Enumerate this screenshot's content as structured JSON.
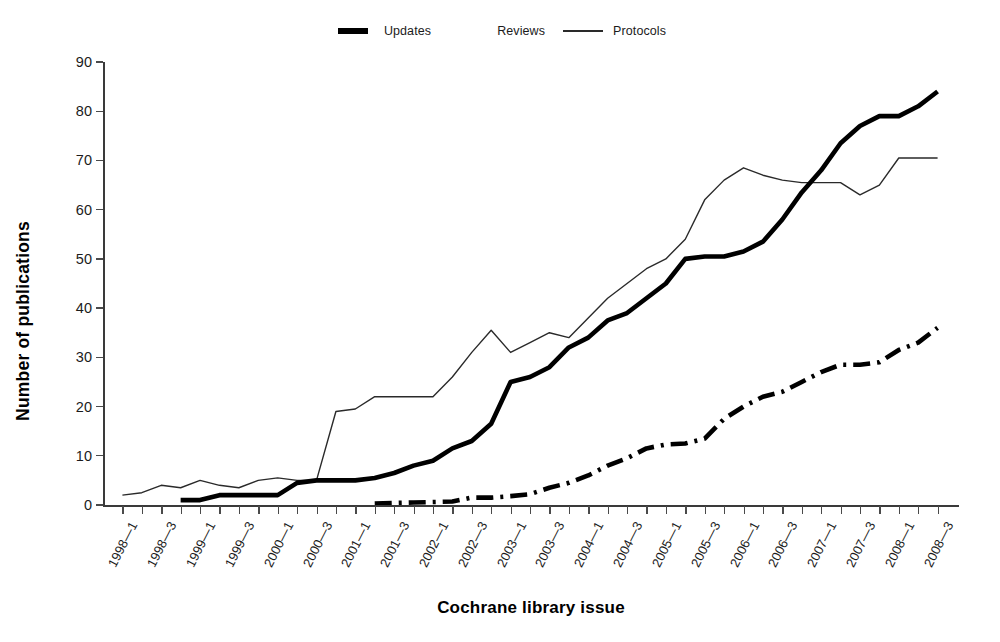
{
  "legend": {
    "entries": [
      {
        "label": "Updates",
        "style": "thick-dashdot",
        "marker": "updates"
      },
      {
        "label": "Reviews",
        "style": "thick-solid",
        "marker": "reviews"
      },
      {
        "label": "Protocols",
        "style": "thin-solid",
        "marker": "protocols"
      }
    ]
  },
  "axes": {
    "ylabel": "Number of publications",
    "xlabel": "Cochrane library issue"
  },
  "chart_data": {
    "type": "line",
    "title": "",
    "subtitle": "",
    "xlabel": "Cochrane library issue",
    "ylabel": "Number of publications",
    "ylim": [
      0,
      90
    ],
    "yticks": [
      0,
      10,
      20,
      30,
      40,
      50,
      60,
      70,
      80,
      90
    ],
    "grid": false,
    "legend_position": "top-center",
    "x": [
      "1998—1",
      "1998—2",
      "1998—3",
      "1998—4",
      "1999—1",
      "1999—2",
      "1999—3",
      "1999—4",
      "2000—1",
      "2000—2",
      "2000—3",
      "2000—4",
      "2001—1",
      "2001—2",
      "2001—3",
      "2001—4",
      "2002—1",
      "2002—2",
      "2002—3",
      "2002—4",
      "2003—1",
      "2003—2",
      "2003—3",
      "2003—4",
      "2004—1",
      "2004—2",
      "2004—3",
      "2004—4",
      "2005—1",
      "2005—2",
      "2005—3",
      "2005—4",
      "2006—1",
      "2006—2",
      "2006—3",
      "2006—4",
      "2007—1",
      "2007—2",
      "2007—3",
      "2007—4",
      "2008—1",
      "2008—2",
      "2008—3"
    ],
    "xtick_labels_shown": [
      "1998—1",
      "1998—3",
      "1999—1",
      "1999—3",
      "2000—1",
      "2000—3",
      "2001—1",
      "2001—3",
      "2002—1",
      "2002—3",
      "2003—1",
      "2003—3",
      "2004—1",
      "2004—3",
      "2005—1",
      "2005—3",
      "2006—1",
      "2006—3",
      "2007—1",
      "2007—3",
      "2008—1",
      "2008—3"
    ],
    "series": [
      {
        "name": "Protocols",
        "style": "thin-solid",
        "color": "#2a2a2a",
        "values": [
          2,
          2.5,
          4,
          3.5,
          5,
          4,
          3.5,
          5,
          5.5,
          5,
          5,
          19,
          19.5,
          22,
          22,
          22,
          22,
          26,
          31,
          35.5,
          31,
          33,
          35,
          34,
          38,
          42,
          45,
          48,
          50,
          54,
          62,
          66,
          68.5,
          67,
          66,
          65.5,
          65.5,
          65.5,
          63,
          65,
          70.5,
          70.5,
          70.5
        ]
      },
      {
        "name": "Reviews",
        "style": "thick-solid",
        "color": "#000000",
        "values": [
          null,
          null,
          null,
          1,
          1,
          2,
          2,
          2,
          2,
          4.5,
          5,
          5,
          5,
          5.5,
          6.5,
          8,
          9,
          11.5,
          13,
          16.5,
          25,
          26,
          28,
          32,
          34,
          37.5,
          39,
          42,
          45,
          50,
          50.5,
          50.5,
          51.5,
          53.5,
          58,
          63.5,
          68,
          73.5,
          77,
          79,
          79,
          81,
          84
        ]
      },
      {
        "name": "Updates",
        "style": "thick-dashdot",
        "color": "#000000",
        "values": [
          null,
          null,
          null,
          null,
          null,
          null,
          null,
          null,
          null,
          null,
          null,
          null,
          null,
          0.3,
          0.4,
          0.5,
          0.6,
          0.7,
          1.5,
          1.5,
          1.8,
          2.2,
          3.5,
          4.5,
          6,
          8,
          9.5,
          11.5,
          12.3,
          12.5,
          13.5,
          17.5,
          20,
          22,
          23,
          25,
          27,
          28.5,
          28.5,
          29,
          31.5,
          33,
          36
        ]
      }
    ]
  }
}
